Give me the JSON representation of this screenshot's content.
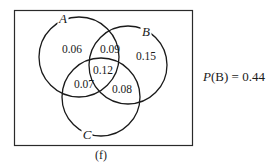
{
  "diagram": {
    "type": "venn",
    "frame": {
      "x": 14,
      "y": 10,
      "w": 178,
      "h": 135
    },
    "sets": [
      {
        "label": "A",
        "cx": 79,
        "cy": 57,
        "r": 40,
        "label_x": 63,
        "label_y": 23
      },
      {
        "label": "B",
        "cx": 128,
        "cy": 65,
        "r": 39,
        "label_x": 146,
        "label_y": 36
      },
      {
        "label": "C",
        "cx": 101,
        "cy": 97,
        "r": 39,
        "label_x": 87,
        "label_y": 139
      }
    ],
    "regions": [
      {
        "name": "A only",
        "value": "0.06",
        "x": 72,
        "y": 53
      },
      {
        "name": "A and B only",
        "value": "0.09",
        "x": 110,
        "y": 53
      },
      {
        "name": "B only",
        "value": "0.15",
        "x": 146,
        "y": 60
      },
      {
        "name": "A and B and C",
        "value": "0.12",
        "x": 103,
        "y": 74
      },
      {
        "name": "A and C only",
        "value": "0.07",
        "x": 84,
        "y": 88
      },
      {
        "name": "B and C only",
        "value": "0.08",
        "x": 122,
        "y": 93
      }
    ],
    "annotation": {
      "prefix": "P",
      "arg": "(B)",
      "rest": " = 0.44"
    },
    "caption": "(f)"
  }
}
